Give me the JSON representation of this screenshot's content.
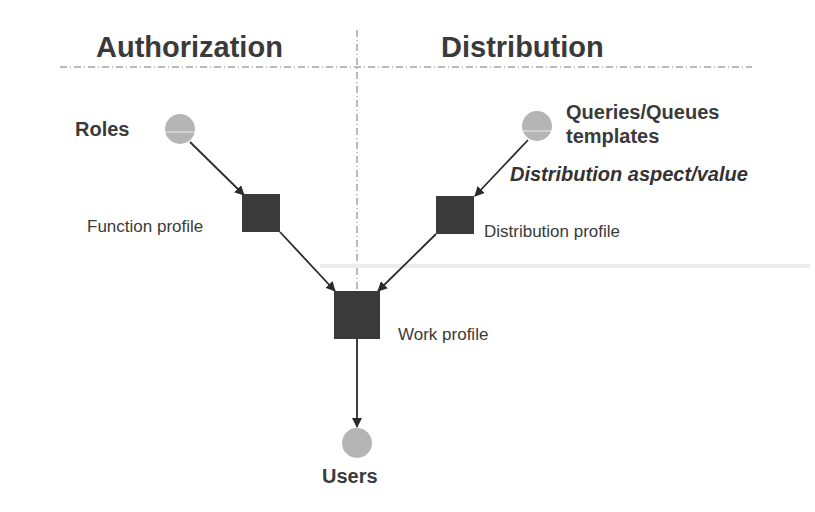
{
  "headers": {
    "left": "Authorization",
    "right": "Distribution"
  },
  "nodes": {
    "roles": {
      "label": "Roles",
      "shape": "circle"
    },
    "queries": {
      "label_line1": "Queries/Queues",
      "label_line2": "templates",
      "shape": "circle"
    },
    "function_profile": {
      "label": "Function profile",
      "shape": "square"
    },
    "distribution_profile": {
      "label": "Distribution profile",
      "shape": "square"
    },
    "work_profile": {
      "label": "Work profile",
      "shape": "square"
    },
    "users": {
      "label": "Users",
      "shape": "circle"
    }
  },
  "edge_labels": {
    "queries_to_distribution": "Distribution aspect/value"
  },
  "edges": [
    {
      "from": "Roles",
      "to": "Function profile"
    },
    {
      "from": "Queries/Queues templates",
      "to": "Distribution profile"
    },
    {
      "from": "Function profile",
      "to": "Work profile"
    },
    {
      "from": "Distribution profile",
      "to": "Work profile"
    },
    {
      "from": "Work profile",
      "to": "Users"
    }
  ],
  "colors": {
    "circle_fill": "#b5b5b5",
    "square_fill": "#3a3a3a",
    "line": "#2b2b2b",
    "divider": "#777777"
  }
}
